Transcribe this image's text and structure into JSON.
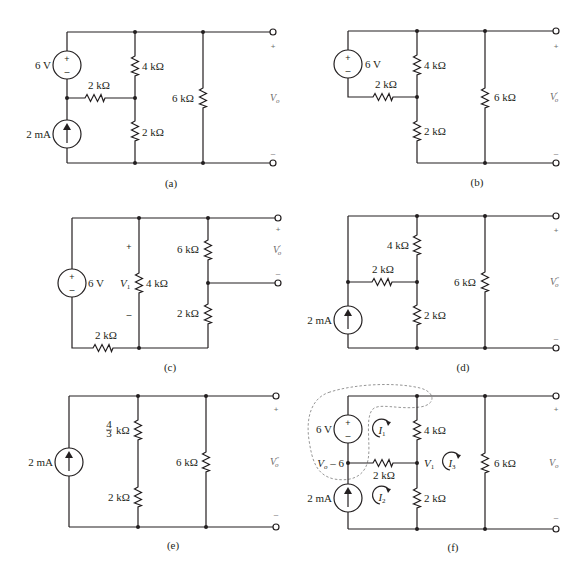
{
  "figure": {
    "panels": [
      {
        "id": "a",
        "caption": "(a)",
        "components": {
          "voltage_source": "6 V",
          "current_source": "2 mA",
          "r_series": "2 kΩ",
          "r_top": "4 kΩ",
          "r_bottom": "2 kΩ",
          "r_load": "6 kΩ"
        },
        "output": {
          "label": "V",
          "sub": "o",
          "plus": "+",
          "minus": "–"
        }
      },
      {
        "id": "b",
        "caption": "(b)",
        "components": {
          "voltage_source": "6 V",
          "r_series": "2 kΩ",
          "r_top": "4 kΩ",
          "r_bottom": "2 kΩ",
          "r_load": "6 kΩ"
        },
        "output": {
          "label": "V",
          "sub": "o",
          "prime": "′",
          "plus": "+",
          "minus": "–"
        }
      },
      {
        "id": "c",
        "caption": "(c)",
        "components": {
          "voltage_source": "6 V",
          "r_series": "2 kΩ",
          "r_mid": "4 kΩ",
          "r_top_right": "6 kΩ",
          "r_bottom_right": "2 kΩ"
        },
        "node_voltage": {
          "label": "V",
          "sub": "1",
          "plus": "+",
          "minus": "–"
        },
        "output": {
          "label": "V",
          "sub": "o",
          "prime": "′",
          "plus": "+",
          "minus": "–"
        }
      },
      {
        "id": "d",
        "caption": "(d)",
        "components": {
          "current_source": "2 mA",
          "r_series": "2 kΩ",
          "r_top": "4 kΩ",
          "r_bottom": "2 kΩ",
          "r_load": "6 kΩ"
        },
        "output": {
          "label": "V",
          "sub": "o",
          "prime": "″",
          "plus": "+",
          "minus": "–"
        }
      },
      {
        "id": "e",
        "caption": "(e)",
        "components": {
          "current_source": "2 mA",
          "r_top_num": "4",
          "r_top_den": "3",
          "r_top_unit": "kΩ",
          "r_bottom": "2 kΩ",
          "r_load": "6 kΩ"
        },
        "output": {
          "label": "V",
          "sub": "o",
          "prime": "″",
          "plus": "+",
          "minus": "–"
        }
      },
      {
        "id": "f",
        "caption": "(f)",
        "components": {
          "voltage_source": "6 V",
          "current_source": "2 mA",
          "r_series": "2 kΩ",
          "r_top": "4 kΩ",
          "r_bottom": "2 kΩ",
          "r_load": "6 kΩ"
        },
        "node_labels": {
          "left_node": "V",
          "left_node_sub": "o",
          "left_node_rest": " – 6",
          "v1": "V",
          "v1_sub": "1"
        },
        "mesh_currents": [
          {
            "label": "I",
            "sub": "1"
          },
          {
            "label": "I",
            "sub": "2"
          },
          {
            "label": "I",
            "sub": "3"
          }
        ],
        "output": {
          "label": "V",
          "sub": "o",
          "plus": "+",
          "minus": "–"
        }
      }
    ],
    "source_symbols": {
      "plus": "+",
      "minus": "–"
    }
  }
}
